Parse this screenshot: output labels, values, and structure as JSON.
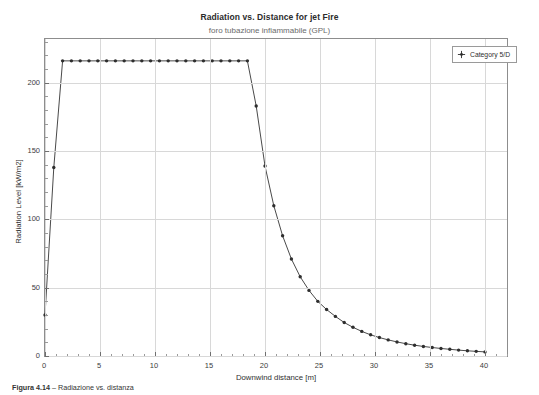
{
  "figure": {
    "title": "Radiation vs. Distance for jet Fire",
    "subtitle": "foro tubazione infiammabile (GPL)",
    "caption_label": "Figura 4.14",
    "caption_text": "– Radiazione vs. distanza"
  },
  "legend": {
    "position": "top-right",
    "entries": [
      {
        "label": "Category 5/D",
        "marker": "plus-diamond-marker",
        "color": "#404040"
      }
    ]
  },
  "colors": {
    "line": "#4a4a4a",
    "marker": "#2e2e2e",
    "grid": "#d8d8d8",
    "frame": "#8d8d8d",
    "background": "#ffffff"
  },
  "chart_data": {
    "type": "line",
    "title": "Radiation vs. Distance for jet Fire",
    "subtitle": "foro tubazione infiammabile (GPL)",
    "xlabel": "Downwind distance [m]",
    "ylabel": "Radiation Level [kW/m2]",
    "xlim": [
      0,
      42
    ],
    "ylim": [
      0,
      232
    ],
    "xticks": [
      0,
      5,
      10,
      15,
      20,
      25,
      30,
      35,
      40
    ],
    "yticks": [
      0,
      50,
      100,
      150,
      200
    ],
    "xtick_labels": [
      "0",
      "5",
      "10",
      "15",
      "20",
      "25",
      "30",
      "35",
      "40"
    ],
    "ytick_labels": [
      "0",
      "50",
      "100",
      "150",
      "200"
    ],
    "grid": true,
    "minor_ticks": true,
    "legend_position": "upper right",
    "series": [
      {
        "name": "Category 5/D",
        "marker": "dot",
        "x": [
          0,
          0.8,
          1.6,
          2.4,
          3.2,
          4.0,
          4.8,
          5.6,
          6.4,
          7.2,
          8.0,
          8.8,
          9.6,
          10.4,
          11.2,
          12.0,
          12.8,
          13.6,
          14.4,
          15.2,
          16.0,
          16.8,
          17.6,
          18.4,
          19.2,
          20.0,
          20.8,
          21.6,
          22.4,
          23.2,
          24.0,
          24.8,
          25.6,
          26.4,
          27.2,
          28.0,
          28.8,
          29.6,
          30.4,
          31.2,
          32.0,
          32.8,
          33.6,
          34.4,
          35.2,
          36.0,
          36.8,
          37.6,
          38.4,
          39.2,
          40.0
        ],
        "y": [
          30,
          138,
          216,
          216,
          216,
          216,
          216,
          216,
          216,
          216,
          216,
          216,
          216,
          216,
          216,
          216,
          216,
          216,
          216,
          216,
          216,
          216,
          216,
          216,
          183,
          139,
          110,
          88,
          71,
          58,
          48,
          40,
          34,
          29,
          24.5,
          21,
          18,
          15.5,
          13.5,
          11.8,
          10.3,
          9.0,
          7.9,
          7.0,
          6.2,
          5.5,
          4.9,
          4.3,
          3.8,
          3.4,
          3.0
        ]
      }
    ]
  }
}
